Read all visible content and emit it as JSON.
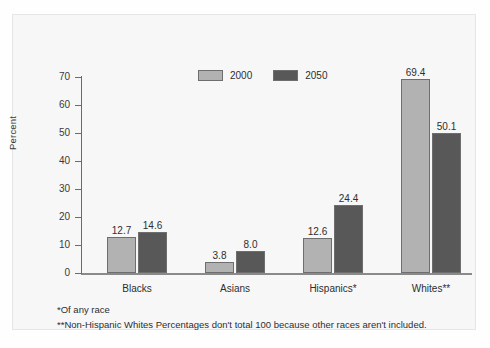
{
  "chart_data": {
    "type": "bar",
    "title": "",
    "xlabel": "",
    "ylabel": "Percent",
    "ylim": [
      0,
      70
    ],
    "yticks": [
      0,
      10,
      20,
      30,
      40,
      50,
      60,
      70
    ],
    "grid": false,
    "legend_position": "top-center",
    "categories": [
      "Blacks",
      "Asians",
      "Hispanics*",
      "Whites**"
    ],
    "series": [
      {
        "name": "2000",
        "color": "#b2b2b2",
        "values": [
          12.7,
          3.8,
          12.6,
          69.4
        ]
      },
      {
        "name": "2050",
        "color": "#585858",
        "values": [
          14.6,
          8.0,
          24.4,
          50.1
        ]
      }
    ],
    "data_labels": [
      [
        "12.7",
        "14.6"
      ],
      [
        "3.8",
        "8.0"
      ],
      [
        "12.6",
        "24.4"
      ],
      [
        "69.4",
        "50.1"
      ]
    ],
    "annotations": [
      "*Of any race",
      "**Non-Hispanic Whites Percentages don't total 100 because other races aren't included."
    ]
  },
  "footnotes": [
    "*Of any race",
    "**Non-Hispanic Whites Percentages don't total 100 because other races aren't included."
  ]
}
